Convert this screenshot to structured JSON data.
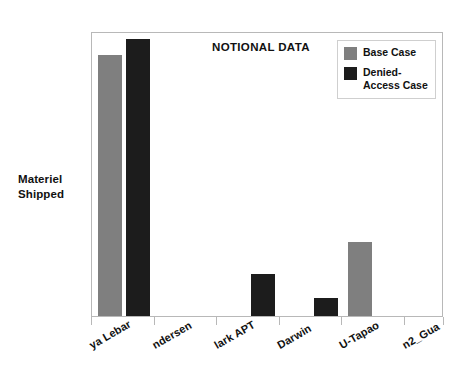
{
  "chart_data": {
    "type": "bar",
    "title": "NOTIONAL DATA",
    "xlabel": "",
    "ylabel": "Materiel Shipped",
    "categories": [
      "Paya Lebar",
      "Andersen",
      "Clark APT",
      "Darwin",
      "U-Tapao",
      "Hmn2_Gua"
    ],
    "category_labels_visible": [
      "ya Lebar",
      "ndersen",
      "lark APT",
      "Darwin",
      "U-Tapao",
      "n2_Gua"
    ],
    "series": [
      {
        "name": "Base Case",
        "color": "#7f7f7f",
        "values": [
          91.5,
          0,
          0,
          0,
          26.0,
          0
        ]
      },
      {
        "name": "Denied-Access Case",
        "color": "#1c1c1c",
        "values": [
          97.2,
          0,
          14.7,
          6.3,
          0,
          0
        ]
      }
    ],
    "ylim": [
      0,
      100
    ],
    "grid": false,
    "y_ticks_shown": false,
    "legend_position": "top-right",
    "axis_color": "#b8b8b8",
    "background": "#ffffff"
  },
  "legend": {
    "items": [
      {
        "label": "Base Case",
        "label_line1": "Base Case",
        "label_line2": "",
        "color": "#7f7f7f"
      },
      {
        "label": "Denied-Access Case",
        "label_line1": "Denied-",
        "label_line2": "Access Case",
        "color": "#1c1c1c"
      }
    ]
  },
  "axis_title": {
    "y_line1": "Materiel",
    "y_line2": "Shipped"
  }
}
